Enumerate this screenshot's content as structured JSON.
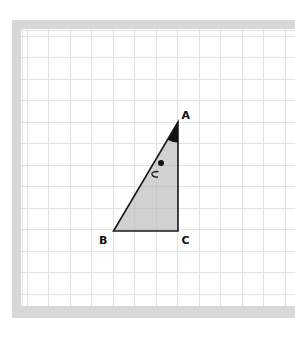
{
  "figure": {
    "type": "right-triangle-on-grid",
    "grid": {
      "cell_size_px": 21.5,
      "origin_x": 26.5,
      "origin_y": 35.5,
      "line_color": "#e2e2e2"
    },
    "frame_color": "#d8d8d8",
    "triangle_fill": "#c9c9c9",
    "stroke_color": "#1a1a1a",
    "vertices": {
      "A": {
        "label": "A",
        "x": 178,
        "y": 122,
        "grid": [
          7,
          4
        ]
      },
      "B": {
        "label": "B",
        "x": 113.5,
        "y": 231,
        "grid": [
          4,
          9
        ]
      },
      "C": {
        "label": "C",
        "x": 178,
        "y": 231,
        "grid": [
          7,
          9
        ]
      }
    },
    "angle_marker_at": "A",
    "marks": {
      "dot": {
        "x": 161,
        "y": 163
      },
      "arc_symbol": {
        "x": 155,
        "y": 174
      }
    }
  }
}
